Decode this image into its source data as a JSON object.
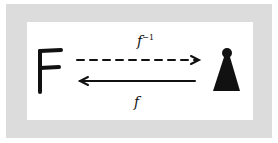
{
  "diagram": {
    "left_node": {
      "label": "F"
    },
    "right_node": {
      "label": "pawn-icon"
    },
    "top_arrow": {
      "label": "f",
      "superscript": "−1",
      "style": "dashed",
      "direction": "left-to-right"
    },
    "bottom_arrow": {
      "label": "f",
      "style": "solid",
      "direction": "right-to-left"
    },
    "colors": {
      "frame": "#dcdcdc",
      "background": "#ffffff",
      "ink": "#111111"
    }
  }
}
